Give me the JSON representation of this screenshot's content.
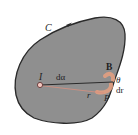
{
  "diagram": {
    "type": "physics-figure",
    "colors": {
      "background": "#ffffff",
      "region_fill": "#8f8f8f",
      "outline": "#2a2a2a",
      "highlight": "#e8a080",
      "text": "#1e1e1e"
    },
    "labels": {
      "curve": "C",
      "point_source": "I",
      "angle_element": "dα",
      "field": "B",
      "angle": "θ",
      "length_element": "dr",
      "point": "P",
      "radius": "r"
    }
  }
}
